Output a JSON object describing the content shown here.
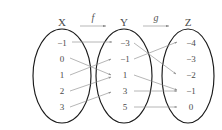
{
  "figure": {
    "width": 222,
    "height": 130,
    "background_color": "#ffffff",
    "outline_color": "#1a1a1a",
    "arrow_color": "#8e8e8e",
    "text_color": "#4a4a4a"
  },
  "sets": [
    {
      "id": "X",
      "name": "X",
      "label": "X",
      "cx": 62,
      "cy": 76,
      "rx": 29,
      "ry": 47,
      "title_x": 62,
      "title_y": 26,
      "elements": [
        {
          "label": "−1",
          "value": -1,
          "x": 62,
          "y": 44
        },
        {
          "label": "0",
          "value": 0,
          "x": 62,
          "y": 60
        },
        {
          "label": "1",
          "value": 1,
          "x": 62,
          "y": 76
        },
        {
          "label": "2",
          "value": 2,
          "x": 62,
          "y": 92
        },
        {
          "label": "3",
          "value": 3,
          "x": 62,
          "y": 108
        }
      ]
    },
    {
      "id": "Y",
      "name": "Y",
      "label": "Y",
      "cx": 124,
      "cy": 76,
      "rx": 28,
      "ry": 47,
      "title_x": 124,
      "title_y": 26,
      "elements": [
        {
          "label": "−3",
          "value": -3,
          "x": 124,
          "y": 44
        },
        {
          "label": "−1",
          "value": -1,
          "x": 124,
          "y": 60
        },
        {
          "label": "1",
          "value": 1,
          "x": 124,
          "y": 76
        },
        {
          "label": "3",
          "value": 3,
          "x": 124,
          "y": 92
        },
        {
          "label": "5",
          "value": 5,
          "x": 124,
          "y": 108
        }
      ]
    },
    {
      "id": "Z",
      "name": "Z",
      "label": "Z",
      "cx": 188,
      "cy": 76,
      "rx": 26,
      "ry": 47,
      "title_x": 188,
      "title_y": 26,
      "elements": [
        {
          "label": "−4",
          "value": -4,
          "x": 190,
          "y": 44
        },
        {
          "label": "−3",
          "value": -3,
          "x": 190,
          "y": 60
        },
        {
          "label": "−2",
          "value": -2,
          "x": 190,
          "y": 76
        },
        {
          "label": "−1",
          "value": -1,
          "x": 190,
          "y": 92
        },
        {
          "label": "0",
          "value": 0,
          "x": 190,
          "y": 108
        }
      ]
    }
  ],
  "maps": [
    {
      "id": "f",
      "label": "f",
      "label_x": 93,
      "label_y": 20,
      "rule_x1": 78,
      "rule_x2": 106,
      "rule_y": 26,
      "from": "X",
      "to": "Y",
      "pairs": [
        {
          "from": "−1",
          "to": "−3",
          "x1": 72,
          "y1": 42,
          "x2": 114,
          "y2": 42
        },
        {
          "from": "0",
          "to": "1",
          "x1": 70,
          "y1": 58,
          "x2": 113,
          "y2": 75
        },
        {
          "from": "1",
          "to": "−1",
          "x1": 70,
          "y1": 75,
          "x2": 113,
          "y2": 59
        },
        {
          "from": "2",
          "to": "1",
          "x1": 70,
          "y1": 91,
          "x2": 113,
          "y2": 77
        },
        {
          "from": "3",
          "to": "3",
          "x1": 70,
          "y1": 107,
          "x2": 113,
          "y2": 92
        }
      ]
    },
    {
      "id": "g",
      "label": "g",
      "label_x": 156,
      "label_y": 20,
      "rule_x1": 142,
      "rule_x2": 170,
      "rule_y": 26,
      "from": "Y",
      "to": "Z",
      "pairs": [
        {
          "from": "−3",
          "to": "−2",
          "x1": 134,
          "y1": 43,
          "x2": 177,
          "y2": 74
        },
        {
          "from": "−1",
          "to": "−4",
          "x1": 134,
          "y1": 59,
          "x2": 178,
          "y2": 42
        },
        {
          "from": "1",
          "to": "−1",
          "x1": 134,
          "y1": 75,
          "x2": 178,
          "y2": 90
        },
        {
          "from": "3",
          "to": "−1",
          "x1": 134,
          "y1": 91,
          "x2": 178,
          "y2": 91
        },
        {
          "from": "5",
          "to": "0",
          "x1": 134,
          "y1": 107,
          "x2": 178,
          "y2": 107
        }
      ]
    }
  ]
}
